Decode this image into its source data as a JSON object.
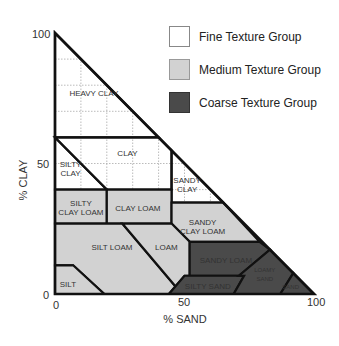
{
  "diagram": {
    "x_axis": {
      "label": "% SAND",
      "ticks": [
        "0",
        "50",
        "100"
      ],
      "tick_values": [
        0,
        50,
        100
      ]
    },
    "y_axis": {
      "label": "% CLAY",
      "ticks": [
        "0",
        "50",
        "100"
      ],
      "tick_values": [
        0,
        50,
        100
      ]
    },
    "legend": [
      {
        "label": "Fine Texture Group",
        "color": "#ffffff"
      },
      {
        "label": "Medium Texture Group",
        "color": "#d2d2d2"
      },
      {
        "label": "Coarse Texture Group",
        "color": "#4a4a4a"
      }
    ],
    "colors": {
      "fine": "#ffffff",
      "medium": "#d2d2d2",
      "coarse": "#4a4a4a",
      "line": "#111111"
    },
    "regions": [
      {
        "name": "HEAVY CLAY",
        "group": "fine",
        "lines": [
          "HEAVY CLAY"
        ],
        "label_at": [
          15,
          77
        ],
        "points": [
          [
            0,
            100
          ],
          [
            0,
            60
          ],
          [
            40,
            60
          ]
        ]
      },
      {
        "name": "CLAY",
        "group": "fine",
        "lines": [
          "CLAY"
        ],
        "label_at": [
          28,
          54
        ],
        "points": [
          [
            0,
            60
          ],
          [
            40,
            60
          ],
          [
            45,
            55
          ],
          [
            45,
            40
          ],
          [
            20,
            40
          ]
        ]
      },
      {
        "name": "SILTY CLAY",
        "group": "fine",
        "lines": [
          "SILTY",
          "CLAY"
        ],
        "label_at": [
          6,
          48
        ],
        "points": [
          [
            0,
            60
          ],
          [
            20,
            40
          ],
          [
            0,
            40
          ]
        ]
      },
      {
        "name": "SANDY CLAY",
        "group": "fine",
        "lines": [
          "SANDY",
          "CLAY"
        ],
        "label_at": [
          51,
          42
        ],
        "points": [
          [
            45,
            55
          ],
          [
            65,
            35
          ],
          [
            45,
            35
          ]
        ]
      },
      {
        "name": "SILTY CLAY LOAM",
        "group": "medium",
        "lines": [
          "SILTY",
          "CLAY LOAM"
        ],
        "label_at": [
          10,
          33
        ],
        "points": [
          [
            0,
            40
          ],
          [
            20,
            40
          ],
          [
            20,
            27
          ],
          [
            0,
            27
          ]
        ]
      },
      {
        "name": "CLAY LOAM",
        "group": "medium",
        "lines": [
          "CLAY LOAM"
        ],
        "label_at": [
          32,
          33
        ],
        "points": [
          [
            20,
            40
          ],
          [
            45,
            40
          ],
          [
            45,
            27
          ],
          [
            20,
            27
          ]
        ]
      },
      {
        "name": "SANDY CLAY LOAM",
        "group": "medium",
        "lines": [
          "SANDY",
          "CLAY LOAM"
        ],
        "label_at": [
          57,
          26
        ],
        "points": [
          [
            45,
            35
          ],
          [
            65,
            35
          ],
          [
            79,
            20
          ],
          [
            52,
            20
          ],
          [
            45,
            27
          ]
        ]
      },
      {
        "name": "SILT LOAM",
        "group": "medium",
        "lines": [
          "SILT LOAM"
        ],
        "label_at": [
          22,
          18
        ],
        "points": [
          [
            0,
            27
          ],
          [
            26,
            27
          ],
          [
            49,
            0
          ],
          [
            19,
            0
          ],
          [
            7,
            11
          ],
          [
            0,
            11
          ]
        ]
      },
      {
        "name": "LOAM",
        "group": "medium",
        "lines": [
          "LOAM"
        ],
        "label_at": [
          43,
          18
        ],
        "points": [
          [
            26,
            27
          ],
          [
            45,
            27
          ],
          [
            52,
            20
          ],
          [
            52,
            7
          ],
          [
            50,
            7
          ],
          [
            44,
            0
          ],
          [
            49,
            0
          ]
        ]
      },
      {
        "name": "SILT",
        "group": "medium",
        "lines": [
          "SILT"
        ],
        "label_at": [
          5,
          4
        ],
        "points": [
          [
            0,
            11
          ],
          [
            7,
            11
          ],
          [
            19,
            0
          ],
          [
            0,
            0
          ]
        ]
      },
      {
        "name": "SANDY LOAM",
        "group": "coarse",
        "lines": [
          "SANDY LOAM"
        ],
        "label_at": [
          66,
          13
        ],
        "points": [
          [
            52,
            20
          ],
          [
            79,
            20
          ],
          [
            83,
            17
          ],
          [
            71,
            7
          ],
          [
            52,
            7
          ]
        ]
      },
      {
        "name": "SILTY SAND",
        "group": "coarse",
        "lines": [
          "SILTY SAND"
        ],
        "label_at": [
          59,
          3
        ],
        "points": [
          [
            50,
            7
          ],
          [
            73,
            7
          ],
          [
            69,
            0
          ],
          [
            44,
            0
          ]
        ]
      },
      {
        "name": "LOAMY SAND",
        "group": "coarse",
        "lines": [
          "LOAMY",
          "SAND"
        ],
        "label_at": [
          81,
          8
        ],
        "points": [
          [
            71,
            7
          ],
          [
            83,
            17
          ],
          [
            92,
            8
          ],
          [
            87,
            0
          ],
          [
            69,
            0
          ],
          [
            73,
            7
          ]
        ]
      },
      {
        "name": "SAND",
        "group": "coarse",
        "lines": [
          "SAND"
        ],
        "label_at": [
          91,
          3
        ],
        "points": [
          [
            92,
            8
          ],
          [
            100,
            0
          ],
          [
            87,
            0
          ]
        ]
      }
    ]
  }
}
